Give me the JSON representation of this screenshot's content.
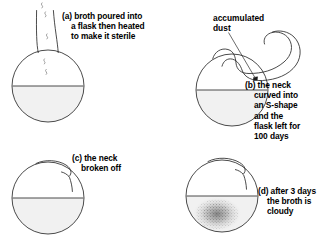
{
  "figure": {
    "stroke_color": "#2b2b2b",
    "liquid_fill_color": "#f1f1f1",
    "background_color": "#ffffff",
    "stipple_color": "#5a5a5a"
  },
  "panels": [
    {
      "id": "a",
      "marker": "(a)",
      "caption_lines": [
        "broth poured into",
        "a flask then heated",
        "to make it sterile"
      ],
      "flask_type": "straight-neck-flask",
      "has_liquid": true,
      "has_vapor_marks": true,
      "vapor_mark_count": 5
    },
    {
      "id": "b",
      "marker": "(b)",
      "caption_lines": [
        "the neck",
        "curved into",
        "an S-shape",
        "and the",
        "flask left for",
        "100 days"
      ],
      "flask_type": "swan-neck-flask",
      "has_liquid": true,
      "has_dust_deposit": true
    },
    {
      "id": "c",
      "marker": "(c)",
      "caption_lines": [
        "the neck",
        "broken off"
      ],
      "flask_type": "broken-neck-flask",
      "has_liquid": true,
      "has_cloudy_broth": false
    },
    {
      "id": "d",
      "marker": "(d)",
      "caption_lines": [
        "after 3 days",
        "the broth is",
        "cloudy"
      ],
      "flask_type": "broken-neck-flask",
      "has_liquid": true,
      "has_cloudy_broth": true
    }
  ],
  "annotations": {
    "dust_label_lines": [
      "accumulated",
      "dust"
    ],
    "dust_leader_line": true
  }
}
